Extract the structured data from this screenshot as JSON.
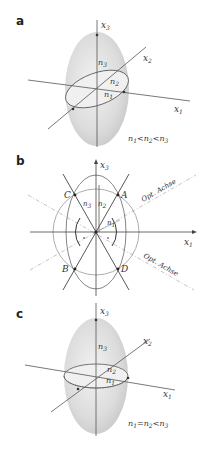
{
  "figure": {
    "panels": [
      {
        "id": "a",
        "label": "a",
        "axes": {
          "x1": "x",
          "x1_sub": "1",
          "x2": "x",
          "x2_sub": "2",
          "x3": "x",
          "x3_sub": "3"
        },
        "indices": {
          "n1": "n",
          "n1_sub": "1",
          "n2": "n",
          "n2_sub": "2",
          "n3": "n",
          "n3_sub": "3"
        },
        "relation": {
          "parts": [
            "n",
            "1",
            "<",
            "n",
            "2",
            "<",
            "n",
            "3"
          ],
          "text": "n1 < n2 < n3"
        }
      },
      {
        "id": "b",
        "label": "b",
        "axes": {
          "x1": "x",
          "x1_sub": "1",
          "x3": "x",
          "x3_sub": "3"
        },
        "indices": {
          "n1": "n",
          "n1_sub": "1",
          "n2": "n",
          "n2_sub": "2",
          "n3": "n",
          "n3_sub": "3"
        },
        "points": [
          "A",
          "B",
          "C",
          "D"
        ],
        "optical_axis_upper": "Opt. Achse",
        "optical_axis_lower": "Opt. Achse"
      },
      {
        "id": "c",
        "label": "c",
        "axes": {
          "x1": "x",
          "x1_sub": "1",
          "x2": "x",
          "x2_sub": "2",
          "x3": "x",
          "x3_sub": "3"
        },
        "indices": {
          "n1": "n",
          "n1_sub": "1",
          "n2": "n",
          "n2_sub": "2",
          "n3": "n",
          "n3_sub": "3"
        },
        "relation": {
          "parts": [
            "n",
            "1",
            "=",
            "n",
            "2",
            "<",
            "n",
            "3"
          ],
          "text": "n1 = n2 < n3"
        }
      }
    ],
    "colors": {
      "ellipsoid_fill": "#d9d9d9",
      "equator_fill": "#eeeeee",
      "line": "#444444",
      "light_line": "#9a9a9a",
      "dashed_line": "#a8a8a8"
    }
  }
}
